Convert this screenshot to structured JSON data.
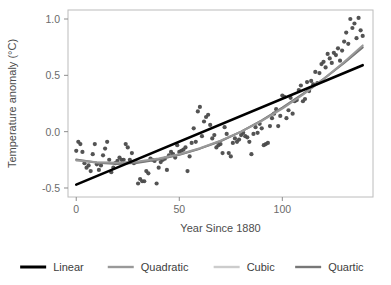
{
  "chart_data": {
    "type": "scatter",
    "title": "",
    "xlabel": "Year Since 1880",
    "ylabel": "Temperature anomaly (°C)",
    "xlim": [
      -4,
      144
    ],
    "ylim": [
      -0.58,
      1.08
    ],
    "xticks": [
      0,
      50,
      100
    ],
    "xticklabels": [
      "0",
      "50",
      "100"
    ],
    "yticks": [
      -0.5,
      0.0,
      0.5,
      1.0
    ],
    "yticklabels": [
      "-0.5",
      "0.0",
      "0.5",
      "1.0"
    ],
    "grid": false,
    "legend_position": "bottom",
    "point_color": "#4a4a4a",
    "point_size": 3,
    "series": [
      {
        "name": "Observations",
        "type": "scatter",
        "x": [
          0,
          1,
          2,
          3,
          4,
          5,
          6,
          7,
          8,
          9,
          10,
          11,
          12,
          13,
          14,
          15,
          16,
          17,
          18,
          19,
          20,
          21,
          22,
          23,
          24,
          25,
          26,
          27,
          28,
          29,
          30,
          31,
          32,
          33,
          34,
          35,
          36,
          37,
          38,
          39,
          40,
          41,
          42,
          43,
          44,
          45,
          46,
          47,
          48,
          49,
          50,
          51,
          52,
          53,
          54,
          55,
          56,
          57,
          58,
          59,
          60,
          61,
          62,
          63,
          64,
          65,
          66,
          67,
          68,
          69,
          70,
          71,
          72,
          73,
          74,
          75,
          76,
          77,
          78,
          79,
          80,
          81,
          82,
          83,
          84,
          85,
          86,
          87,
          88,
          89,
          90,
          91,
          92,
          93,
          94,
          95,
          96,
          97,
          98,
          99,
          100,
          101,
          102,
          103,
          104,
          105,
          106,
          107,
          108,
          109,
          110,
          111,
          112,
          113,
          114,
          115,
          116,
          117,
          118,
          119,
          120,
          121,
          122,
          123,
          124,
          125,
          126,
          127,
          128,
          129,
          130,
          131,
          132,
          133,
          134,
          135,
          136,
          137,
          138,
          139
        ],
        "y": [
          -0.17,
          -0.09,
          -0.11,
          -0.18,
          -0.28,
          -0.32,
          -0.3,
          -0.35,
          -0.2,
          -0.11,
          -0.29,
          -0.34,
          -0.3,
          -0.21,
          -0.15,
          -0.09,
          -0.25,
          -0.36,
          -0.32,
          -0.28,
          -0.26,
          -0.23,
          -0.25,
          -0.25,
          -0.11,
          -0.14,
          -0.25,
          -0.19,
          -0.28,
          -0.27,
          -0.46,
          -0.42,
          -0.44,
          -0.44,
          -0.35,
          -0.37,
          -0.24,
          -0.25,
          -0.26,
          -0.46,
          -0.32,
          -0.27,
          -0.25,
          -0.24,
          -0.34,
          -0.21,
          -0.18,
          -0.2,
          -0.23,
          -0.12,
          -0.18,
          -0.17,
          -0.16,
          -0.14,
          -0.35,
          -0.22,
          -0.1,
          0.03,
          -0.09,
          0.18,
          0.22,
          -0.04,
          0.09,
          0.13,
          0.15,
          0.06,
          -0.06,
          -0.03,
          -0.14,
          -0.12,
          -0.11,
          -0.19,
          0.04,
          -0.02,
          -0.19,
          -0.22,
          -0.1,
          -0.06,
          -0.09,
          -0.07,
          -0.03,
          -0.01,
          -0.04,
          -0.05,
          -0.09,
          -0.2,
          -0.02,
          0.04,
          -0.01,
          0.07,
          0.03,
          -0.12,
          -0.11,
          -0.1,
          0.05,
          0.12,
          0.16,
          0.2,
          0.05,
          0.14,
          0.32,
          0.31,
          0.12,
          0.19,
          0.3,
          0.16,
          0.27,
          0.28,
          0.37,
          0.41,
          0.27,
          0.29,
          0.44,
          0.36,
          0.45,
          0.42,
          0.53,
          0.43,
          0.52,
          0.6,
          0.62,
          0.57,
          0.69,
          0.65,
          0.61,
          0.7,
          0.68,
          0.74,
          0.63,
          0.72,
          0.8,
          0.88,
          0.78,
          1.0,
          0.92,
          0.96,
          0.83,
          1.01,
          0.9,
          0.85
        ]
      },
      {
        "name": "Linear",
        "type": "line",
        "color": "#000000",
        "width": 2.6,
        "x": [
          0,
          139
        ],
        "y": [
          -0.47,
          0.59
        ]
      },
      {
        "name": "Quadratic",
        "type": "line",
        "color": "#999999",
        "width": 2.0,
        "x": [
          0,
          10,
          20,
          30,
          40,
          50,
          60,
          70,
          80,
          90,
          100,
          110,
          120,
          130,
          139
        ],
        "y": [
          -0.255,
          -0.272,
          -0.275,
          -0.264,
          -0.239,
          -0.2,
          -0.147,
          -0.08,
          0.001,
          0.096,
          0.205,
          0.328,
          0.466,
          0.618,
          0.766
        ]
      },
      {
        "name": "Cubic",
        "type": "line",
        "color": "#cccccc",
        "width": 2.0,
        "x": [
          0,
          10,
          20,
          30,
          40,
          50,
          60,
          70,
          80,
          90,
          100,
          110,
          120,
          130,
          139
        ],
        "y": [
          -0.25,
          -0.272,
          -0.281,
          -0.272,
          -0.246,
          -0.205,
          -0.15,
          -0.083,
          0.0,
          0.098,
          0.21,
          0.334,
          0.47,
          0.615,
          0.752
        ]
      },
      {
        "name": "Quartic",
        "type": "line",
        "color": "#777777",
        "width": 2.0,
        "x": [
          0,
          10,
          20,
          30,
          40,
          50,
          60,
          70,
          80,
          90,
          100,
          110,
          120,
          130,
          139
        ],
        "y": [
          -0.248,
          -0.276,
          -0.286,
          -0.276,
          -0.248,
          -0.206,
          -0.151,
          -0.085,
          0.0,
          0.1,
          0.213,
          0.336,
          0.468,
          0.61,
          0.748
        ]
      }
    ]
  },
  "legend": {
    "items": [
      {
        "label": "Linear",
        "color": "#000000"
      },
      {
        "label": "Quadratic",
        "color": "#999999"
      },
      {
        "label": "Cubic",
        "color": "#cccccc"
      },
      {
        "label": "Quartic",
        "color": "#777777"
      }
    ]
  },
  "panel": {
    "border_color": "#bcbcbc",
    "background": "#ffffff"
  }
}
